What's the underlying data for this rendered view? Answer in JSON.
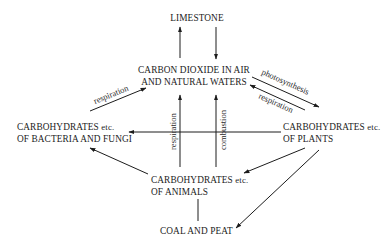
{
  "diagram": {
    "nodes": {
      "limestone": {
        "line1": "LIMESTONE"
      },
      "co2": {
        "line1": "CARBON DIOXIDE IN AIR",
        "line2": "AND NATURAL WATERS"
      },
      "bacteria": {
        "line1": "CARBOHYDRATES",
        "etc": "etc.",
        "line2": "OF BACTERIA AND FUNGI"
      },
      "plants": {
        "line1": "CARBOHYDRATES",
        "etc": "etc.",
        "line2": "OF PLANTS"
      },
      "animals": {
        "line1": "CARBOHYDRATES",
        "etc": "etc.",
        "line2": "OF ANIMALS"
      },
      "coal": {
        "line1": "COAL AND PEAT"
      }
    },
    "edge_labels": {
      "bacteria_to_co2": "respiration",
      "co2_to_plants": "photosynthesis",
      "plants_to_co2": "respiration",
      "animals_to_co2_left": "respiration",
      "to_co2_right": "combustion"
    },
    "edges": [
      {
        "from": "co2",
        "to": "limestone"
      },
      {
        "from": "limestone",
        "to": "co2"
      },
      {
        "from": "bacteria",
        "to": "co2",
        "label": "respiration"
      },
      {
        "from": "co2",
        "to": "plants",
        "label": "photosynthesis"
      },
      {
        "from": "plants",
        "to": "co2",
        "label": "respiration"
      },
      {
        "from": "animals",
        "to": "co2",
        "label": "respiration"
      },
      {
        "from": "animals",
        "to": "co2",
        "label": "combustion"
      },
      {
        "from": "plants",
        "to": "bacteria"
      },
      {
        "from": "animals",
        "to": "bacteria"
      },
      {
        "from": "plants",
        "to": "animals"
      },
      {
        "from": "plants",
        "to": "coal"
      },
      {
        "from": "animals",
        "to": "coal"
      }
    ],
    "colors": {
      "ink": "#1c1c1c",
      "background": "#ffffff"
    }
  }
}
